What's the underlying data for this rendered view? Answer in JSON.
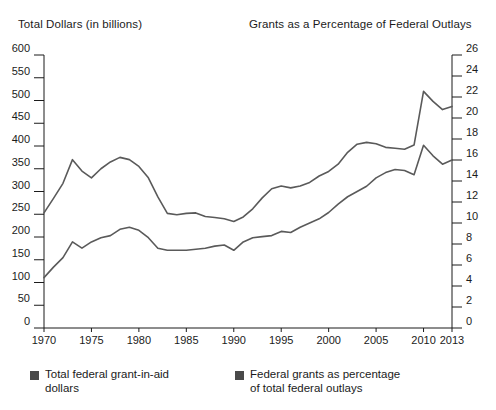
{
  "header": {
    "left_title": "Total Dollars (in billions)",
    "right_title": "Grants as a Percentage of Federal Outlays"
  },
  "legend": {
    "swatch_color": "#4a4a4a",
    "items": [
      {
        "label_line1": "Total federal grant-in-aid",
        "label_line2": "dollars",
        "name": "legend-total-dollars"
      },
      {
        "label_line1": "Federal grants as percentage",
        "label_line2": "of total federal outlays",
        "name": "legend-percentage"
      }
    ]
  },
  "chart_data": {
    "type": "line",
    "title": "",
    "subtitle": "",
    "xlabel": "",
    "ylabel": "Total Dollars (in billions)",
    "y2label": "Grants as a Percentage of Federal Outlays",
    "grid": false,
    "legend_position": "bottom",
    "line_color": "#5a5a5a",
    "axis_color": "#1b1b1b",
    "xlim": [
      1970,
      2013
    ],
    "ylim": [
      0,
      600
    ],
    "y2lim": [
      0,
      26
    ],
    "xticks": [
      1970,
      1975,
      1980,
      1985,
      1990,
      1995,
      2000,
      2005,
      2010,
      2013
    ],
    "xticklabels": [
      "1970",
      "1975",
      "1980",
      "1985",
      "1990",
      "1995",
      "2000",
      "2005",
      "2010",
      "2013"
    ],
    "yticks": [
      0,
      50,
      100,
      150,
      200,
      250,
      300,
      350,
      400,
      450,
      500,
      550,
      600
    ],
    "yticklabels": [
      "0",
      "50",
      "100",
      "150",
      "200",
      "250",
      "300",
      "350",
      "400",
      "450",
      "500",
      "550",
      "600"
    ],
    "y2ticks": [
      0,
      2,
      4,
      6,
      8,
      10,
      12,
      14,
      16,
      18,
      20,
      22,
      24,
      26
    ],
    "y2ticklabels": [
      "0",
      "2",
      "4",
      "6",
      "8",
      "10",
      "12",
      "14",
      "16",
      "18",
      "20",
      "22",
      "24",
      "26"
    ],
    "x": [
      1970,
      1971,
      1972,
      1973,
      1974,
      1975,
      1976,
      1977,
      1978,
      1979,
      1980,
      1981,
      1982,
      1983,
      1984,
      1985,
      1986,
      1987,
      1988,
      1989,
      1990,
      1991,
      1992,
      1993,
      1994,
      1995,
      1996,
      1997,
      1998,
      1999,
      2000,
      2001,
      2002,
      2003,
      2004,
      2005,
      2006,
      2007,
      2008,
      2009,
      2010,
      2011,
      2012,
      2013
    ],
    "series": [
      {
        "name": "Total federal grant-in-aid dollars",
        "axis": "left",
        "unit": "billions of dollars",
        "values": [
          253,
          285,
          318,
          370,
          345,
          330,
          350,
          365,
          375,
          370,
          355,
          330,
          288,
          252,
          249,
          252,
          253,
          245,
          243,
          240,
          234,
          244,
          262,
          286,
          306,
          312,
          308,
          312,
          320,
          334,
          344,
          360,
          386,
          404,
          408,
          405,
          397,
          395,
          393,
          402,
          520,
          498,
          480,
          487
        ]
      },
      {
        "name": "Federal grants as percentage of total federal outlays",
        "axis": "right",
        "unit": "percent",
        "values": [
          4.8,
          5.8,
          6.7,
          8.2,
          7.6,
          8.2,
          8.6,
          8.8,
          9.4,
          9.6,
          9.3,
          8.6,
          7.6,
          7.4,
          7.4,
          7.4,
          7.5,
          7.6,
          7.8,
          7.9,
          7.4,
          8.2,
          8.6,
          8.7,
          8.8,
          9.2,
          9.1,
          9.6,
          10.0,
          10.4,
          11.0,
          11.8,
          12.5,
          13.0,
          13.5,
          14.3,
          14.8,
          15.1,
          15.0,
          14.6,
          17.4,
          16.4,
          15.6,
          16.0
        ]
      }
    ]
  }
}
